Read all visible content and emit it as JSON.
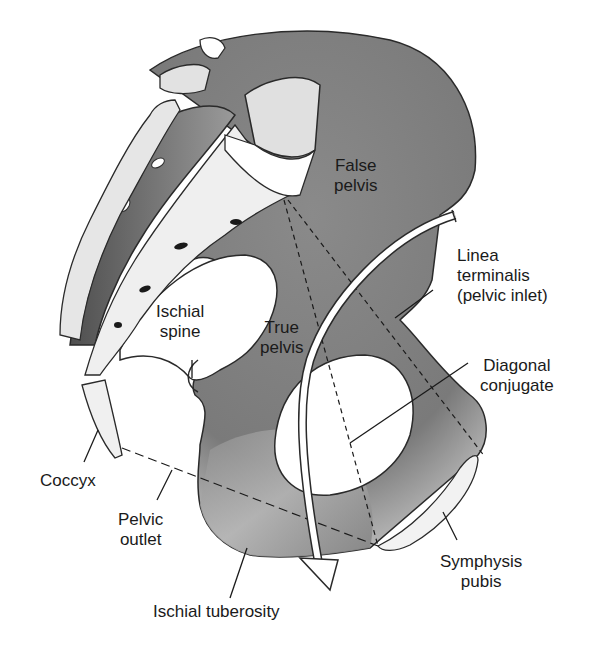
{
  "diagram": {
    "labels": {
      "false_pelvis": "False\npelvis",
      "linea_terminalis": "Linea\nterminalis\n(pelvic inlet)",
      "ischial_spine": "Ischial\nspine",
      "true_pelvis": "True\npelvis",
      "diagonal_conjugate": "Diagonal\nconjugate",
      "coccyx": "Coccyx",
      "pelvic_outlet": "Pelvic\noutlet",
      "symphysis_pubis": "Symphysis\npubis",
      "ischial_tuberosity": "Ischial tuberosity"
    },
    "colors": {
      "bone_dark": "#6e6e6e",
      "bone_mid": "#9a9a9a",
      "bone_light": "#d8d8d8",
      "outline": "#2a2a2a",
      "background": "#ffffff"
    }
  }
}
